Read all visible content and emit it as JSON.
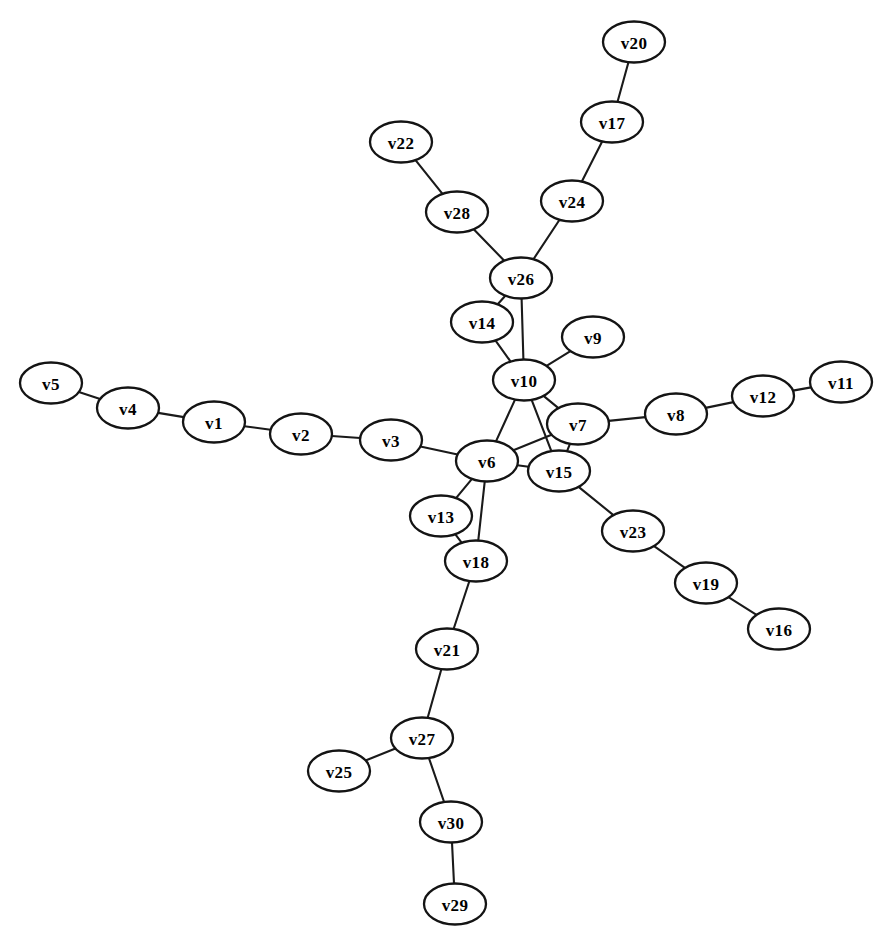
{
  "diagram": {
    "type": "node-link-graph",
    "layout": "spring",
    "background_color": "#ffffff",
    "node_fill_color": "#ffffff",
    "node_stroke_color": "#141414",
    "edge_color": "#1a1a1a",
    "label_color": "#000000",
    "node_width": 62,
    "node_height": 41,
    "node_count": 30,
    "edge_count": 33
  },
  "nodes": [
    {
      "id": "v5",
      "label": "v5",
      "x": 51,
      "y": 383
    },
    {
      "id": "v4",
      "label": "v4",
      "x": 128,
      "y": 408
    },
    {
      "id": "v1",
      "label": "v1",
      "x": 214,
      "y": 422
    },
    {
      "id": "v2",
      "label": "v2",
      "x": 301,
      "y": 434
    },
    {
      "id": "v3",
      "label": "v3",
      "x": 391,
      "y": 440
    },
    {
      "id": "v6",
      "label": "v6",
      "x": 487,
      "y": 461
    },
    {
      "id": "v13",
      "label": "v13",
      "x": 441,
      "y": 516
    },
    {
      "id": "v18",
      "label": "v18",
      "x": 476,
      "y": 561
    },
    {
      "id": "v21",
      "label": "v21",
      "x": 447,
      "y": 649
    },
    {
      "id": "v27",
      "label": "v27",
      "x": 422,
      "y": 738
    },
    {
      "id": "v25",
      "label": "v25",
      "x": 339,
      "y": 771
    },
    {
      "id": "v30",
      "label": "v30",
      "x": 451,
      "y": 822
    },
    {
      "id": "v29",
      "label": "v29",
      "x": 455,
      "y": 904
    },
    {
      "id": "v15",
      "label": "v15",
      "x": 559,
      "y": 471
    },
    {
      "id": "v23",
      "label": "v23",
      "x": 633,
      "y": 531
    },
    {
      "id": "v19",
      "label": "v19",
      "x": 706,
      "y": 583
    },
    {
      "id": "v16",
      "label": "v16",
      "x": 779,
      "y": 629
    },
    {
      "id": "v7",
      "label": "v7",
      "x": 578,
      "y": 424
    },
    {
      "id": "v8",
      "label": "v8",
      "x": 676,
      "y": 414
    },
    {
      "id": "v12",
      "label": "v12",
      "x": 763,
      "y": 396
    },
    {
      "id": "v11",
      "label": "v11",
      "x": 841,
      "y": 382
    },
    {
      "id": "v10",
      "label": "v10",
      "x": 524,
      "y": 380
    },
    {
      "id": "v9",
      "label": "v9",
      "x": 593,
      "y": 337
    },
    {
      "id": "v14",
      "label": "v14",
      "x": 482,
      "y": 322
    },
    {
      "id": "v26",
      "label": "v26",
      "x": 521,
      "y": 278
    },
    {
      "id": "v28",
      "label": "v28",
      "x": 457,
      "y": 212
    },
    {
      "id": "v22",
      "label": "v22",
      "x": 401,
      "y": 142
    },
    {
      "id": "v24",
      "label": "v24",
      "x": 572,
      "y": 201
    },
    {
      "id": "v17",
      "label": "v17",
      "x": 612,
      "y": 122
    },
    {
      "id": "v20",
      "label": "v20",
      "x": 634,
      "y": 42
    }
  ],
  "edges": [
    {
      "source": "v5",
      "target": "v4"
    },
    {
      "source": "v4",
      "target": "v1"
    },
    {
      "source": "v1",
      "target": "v2"
    },
    {
      "source": "v2",
      "target": "v3"
    },
    {
      "source": "v3",
      "target": "v6"
    },
    {
      "source": "v6",
      "target": "v10"
    },
    {
      "source": "v6",
      "target": "v7"
    },
    {
      "source": "v6",
      "target": "v15"
    },
    {
      "source": "v6",
      "target": "v13"
    },
    {
      "source": "v6",
      "target": "v18"
    },
    {
      "source": "v13",
      "target": "v18"
    },
    {
      "source": "v18",
      "target": "v21"
    },
    {
      "source": "v21",
      "target": "v27"
    },
    {
      "source": "v27",
      "target": "v25"
    },
    {
      "source": "v27",
      "target": "v30"
    },
    {
      "source": "v30",
      "target": "v29"
    },
    {
      "source": "v15",
      "target": "v7"
    },
    {
      "source": "v15",
      "target": "v10"
    },
    {
      "source": "v15",
      "target": "v23"
    },
    {
      "source": "v23",
      "target": "v19"
    },
    {
      "source": "v19",
      "target": "v16"
    },
    {
      "source": "v7",
      "target": "v10"
    },
    {
      "source": "v7",
      "target": "v8"
    },
    {
      "source": "v8",
      "target": "v12"
    },
    {
      "source": "v12",
      "target": "v11"
    },
    {
      "source": "v10",
      "target": "v9"
    },
    {
      "source": "v10",
      "target": "v14"
    },
    {
      "source": "v10",
      "target": "v26"
    },
    {
      "source": "v14",
      "target": "v26"
    },
    {
      "source": "v26",
      "target": "v28"
    },
    {
      "source": "v26",
      "target": "v24"
    },
    {
      "source": "v28",
      "target": "v22"
    },
    {
      "source": "v24",
      "target": "v17"
    },
    {
      "source": "v17",
      "target": "v20"
    }
  ]
}
